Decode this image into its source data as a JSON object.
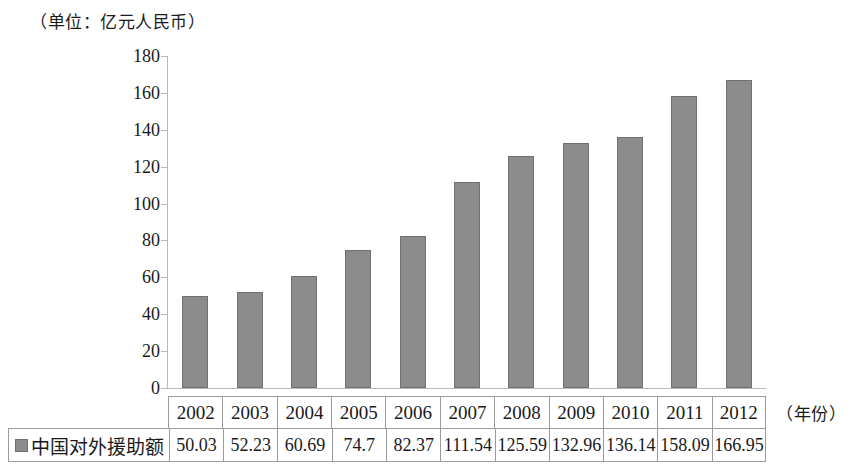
{
  "unit_caption": "（单位：亿元人民币）",
  "axis_title": "（年份）",
  "legend": {
    "label": "中国对外援助额",
    "swatch_color": "#8c8c8c"
  },
  "chart_data": {
    "type": "bar",
    "title": "（单位：亿元人民币）",
    "xlabel": "（年份）",
    "ylabel": "",
    "ylim": [
      0,
      180
    ],
    "yticks": [
      0,
      20,
      40,
      60,
      80,
      100,
      120,
      140,
      160,
      180
    ],
    "grid": false,
    "legend_position": "bottom-table",
    "categories": [
      "2002",
      "2003",
      "2004",
      "2005",
      "2006",
      "2007",
      "2008",
      "2009",
      "2010",
      "2011",
      "2012"
    ],
    "series": [
      {
        "name": "中国对外援助额",
        "color": "#8c8c8c",
        "values": [
          50.03,
          52.23,
          60.69,
          74.7,
          82.37,
          111.54,
          125.59,
          132.96,
          136.14,
          158.09,
          166.95
        ]
      }
    ],
    "value_labels": [
      "50.03",
      "52.23",
      "60.69",
      "74.7",
      "82.37",
      "111.54",
      "125.59",
      "132.96",
      "136.14",
      "158.09",
      "166.95"
    ]
  }
}
